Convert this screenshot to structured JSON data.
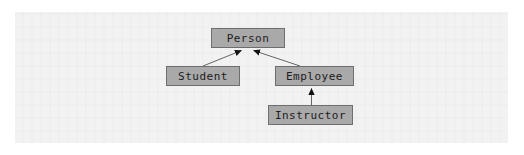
{
  "diagram": {
    "type": "uml-class-diagram",
    "background_color": "#f2f2f2",
    "node_fill_color": "#a9a9a9",
    "node_border_color": "#6e6e6e",
    "edge_color": "#555555",
    "arrowhead_color": "#111111",
    "arrowhead_style": "solid-triangle",
    "nodes": [
      {
        "id": "person",
        "label": "Person",
        "x": 211,
        "y": 28,
        "width": 74,
        "height": 20
      },
      {
        "id": "student",
        "label": "Student",
        "x": 166,
        "y": 66,
        "width": 74,
        "height": 20
      },
      {
        "id": "employee",
        "label": "Employee",
        "x": 275,
        "y": 66,
        "width": 79,
        "height": 20
      },
      {
        "id": "instructor",
        "label": "Instructor",
        "x": 268,
        "y": 105,
        "width": 85,
        "height": 20
      }
    ],
    "edges": [
      {
        "id": "student-to-person",
        "from": "Student",
        "to": "Person",
        "relation": "generalization"
      },
      {
        "id": "employee-to-person",
        "from": "Employee",
        "to": "Person",
        "relation": "generalization"
      },
      {
        "id": "instructor-to-employee",
        "from": "Instructor",
        "to": "Employee",
        "relation": "generalization"
      }
    ]
  }
}
